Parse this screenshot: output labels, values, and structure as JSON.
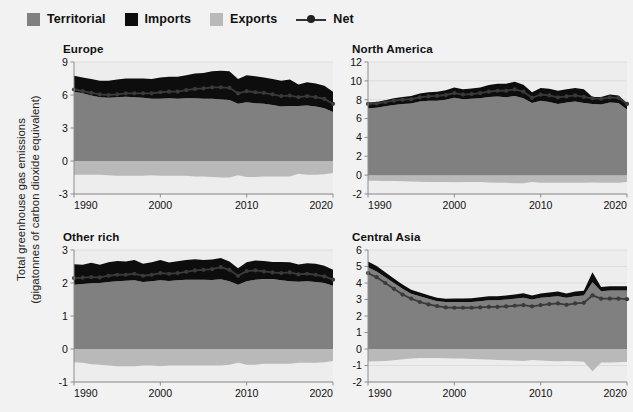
{
  "legend": {
    "items": [
      {
        "label": "Territorial",
        "icon": "square-swatch",
        "color": "#808080"
      },
      {
        "label": "Imports",
        "icon": "square-swatch",
        "color": "#0d0d0d"
      },
      {
        "label": "Exports",
        "icon": "square-swatch",
        "color": "#b9b9b9"
      },
      {
        "label": "Net",
        "icon": "line-marker-swatch",
        "color": "#333333"
      }
    ]
  },
  "axis_title": {
    "line1": "Total greenhouse gas emissions",
    "line2": "(gigatonnes of carbon dioxide equivalent)"
  },
  "colors": {
    "background": "#f2f2f2",
    "plot_background": "#ededed",
    "territorial": "#808080",
    "imports": "#0d0d0d",
    "exports": "#b9b9b9",
    "net_line": "#3a3a3a",
    "axis": "#8d8d8d",
    "grid": "#d8d8d8",
    "text": "#111111"
  },
  "chart_data": [
    {
      "type": "area",
      "title": "Europe",
      "xlabel": "",
      "ylabel": "Total greenhouse gas emissions (gigatonnes of carbon dioxide equivalent)",
      "x": [
        1990,
        1991,
        1992,
        1993,
        1994,
        1995,
        1996,
        1997,
        1998,
        1999,
        2000,
        2001,
        2002,
        2003,
        2004,
        2005,
        2006,
        2007,
        2008,
        2009,
        2010,
        2011,
        2012,
        2013,
        2014,
        2015,
        2016,
        2017,
        2018,
        2019,
        2020
      ],
      "xlim": [
        1990,
        2020
      ],
      "xticks": [
        1990,
        2000,
        2010,
        2020
      ],
      "ylim": [
        -3,
        9
      ],
      "yticks": [
        -3,
        0,
        3,
        6,
        9
      ],
      "grid": true,
      "legend_position": "top",
      "series": [
        {
          "name": "Territorial",
          "stack": "positive",
          "values": [
            6.3,
            6.15,
            5.95,
            5.8,
            5.75,
            5.8,
            5.85,
            5.8,
            5.75,
            5.65,
            5.65,
            5.7,
            5.65,
            5.7,
            5.7,
            5.65,
            5.65,
            5.6,
            5.55,
            5.2,
            5.35,
            5.25,
            5.2,
            5.1,
            4.95,
            5.0,
            5.0,
            5.05,
            4.95,
            4.8,
            4.45
          ],
          "note": "territorial emissions, gigatonnes CO2e"
        },
        {
          "name": "Imports",
          "stack": "positive",
          "values": [
            1.45,
            1.45,
            1.5,
            1.5,
            1.55,
            1.6,
            1.65,
            1.7,
            1.75,
            1.8,
            1.95,
            1.95,
            2.0,
            2.1,
            2.25,
            2.35,
            2.5,
            2.6,
            2.6,
            2.25,
            2.45,
            2.45,
            2.4,
            2.35,
            2.35,
            2.4,
            1.95,
            2.1,
            2.1,
            2.05,
            1.85
          ],
          "note": "emissions embodied in imports, stacked above territorial"
        },
        {
          "name": "Exports",
          "stack": "negative",
          "values": [
            -1.25,
            -1.25,
            -1.25,
            -1.25,
            -1.3,
            -1.35,
            -1.35,
            -1.35,
            -1.35,
            -1.3,
            -1.35,
            -1.35,
            -1.35,
            -1.35,
            -1.4,
            -1.4,
            -1.45,
            -1.5,
            -1.5,
            -1.3,
            -1.45,
            -1.45,
            -1.4,
            -1.4,
            -1.4,
            -1.4,
            -1.15,
            -1.25,
            -1.25,
            -1.2,
            -1.1
          ],
          "note": "emissions embodied in exports, plotted below zero"
        },
        {
          "name": "Net",
          "stack": "line",
          "values": [
            6.5,
            6.35,
            6.2,
            6.05,
            6.0,
            6.05,
            6.15,
            6.15,
            6.15,
            6.15,
            6.25,
            6.3,
            6.3,
            6.45,
            6.55,
            6.6,
            6.7,
            6.7,
            6.65,
            6.15,
            6.35,
            6.25,
            6.2,
            6.05,
            5.9,
            5.95,
            5.8,
            5.9,
            5.8,
            5.65,
            5.2
          ],
          "note": "net consumption emissions = territorial + imports - exports"
        }
      ]
    },
    {
      "type": "area",
      "title": "North America",
      "xlabel": "",
      "ylabel": "Total greenhouse gas emissions (gigatonnes of carbon dioxide equivalent)",
      "x": [
        1990,
        1991,
        1992,
        1993,
        1994,
        1995,
        1996,
        1997,
        1998,
        1999,
        2000,
        2001,
        2002,
        2003,
        2004,
        2005,
        2006,
        2007,
        2008,
        2009,
        2010,
        2011,
        2012,
        2013,
        2014,
        2015,
        2016,
        2017,
        2018,
        2019,
        2020
      ],
      "xlim": [
        1990,
        2020
      ],
      "xticks": [
        1990,
        2000,
        2010,
        2020
      ],
      "ylim": [
        -2,
        12
      ],
      "yticks": [
        -2,
        0,
        2,
        4,
        6,
        8,
        10,
        12
      ],
      "grid": true,
      "legend_position": "top",
      "series": [
        {
          "name": "Territorial",
          "stack": "positive",
          "values": [
            7.1,
            7.15,
            7.3,
            7.45,
            7.55,
            7.6,
            7.8,
            7.9,
            7.9,
            8.0,
            8.2,
            8.05,
            8.1,
            8.15,
            8.3,
            8.35,
            8.25,
            8.4,
            8.15,
            7.65,
            7.9,
            7.75,
            7.55,
            7.7,
            7.8,
            7.65,
            7.55,
            7.5,
            7.7,
            7.65,
            6.95
          ],
          "note": "territorial emissions, gigatonnes CO2e"
        },
        {
          "name": "Imports",
          "stack": "positive",
          "values": [
            0.6,
            0.6,
            0.65,
            0.7,
            0.75,
            0.8,
            0.85,
            0.9,
            0.95,
            1.0,
            1.1,
            1.05,
            1.1,
            1.15,
            1.25,
            1.35,
            1.45,
            1.5,
            1.45,
            1.15,
            1.35,
            1.4,
            1.4,
            1.4,
            1.45,
            1.45,
            0.75,
            0.8,
            0.85,
            0.8,
            0.7
          ],
          "note": "emissions embodied in imports, stacked above territorial"
        },
        {
          "name": "Exports",
          "stack": "negative",
          "values": [
            -0.6,
            -0.6,
            -0.62,
            -0.63,
            -0.65,
            -0.68,
            -0.7,
            -0.72,
            -0.72,
            -0.72,
            -0.75,
            -0.72,
            -0.72,
            -0.74,
            -0.78,
            -0.8,
            -0.82,
            -0.85,
            -0.85,
            -0.72,
            -0.8,
            -0.82,
            -0.8,
            -0.8,
            -0.82,
            -0.82,
            -0.78,
            -0.8,
            -0.82,
            -0.8,
            -0.72
          ],
          "note": "emissions embodied in exports, plotted below zero"
        },
        {
          "name": "Net",
          "stack": "line",
          "values": [
            7.55,
            7.6,
            7.75,
            7.9,
            8.0,
            8.05,
            8.25,
            8.35,
            8.4,
            8.5,
            8.7,
            8.55,
            8.6,
            8.7,
            8.85,
            8.95,
            8.95,
            9.1,
            8.85,
            8.2,
            8.55,
            8.45,
            8.25,
            8.35,
            8.45,
            8.3,
            8.15,
            8.1,
            8.25,
            8.2,
            7.55
          ],
          "note": "net consumption emissions = territorial + imports - exports"
        }
      ]
    },
    {
      "type": "area",
      "title": "Other rich",
      "xlabel": "",
      "ylabel": "Total greenhouse gas emissions (gigatonnes of carbon dioxide equivalent)",
      "x": [
        1990,
        1991,
        1992,
        1993,
        1994,
        1995,
        1996,
        1997,
        1998,
        1999,
        2000,
        2001,
        2002,
        2003,
        2004,
        2005,
        2006,
        2007,
        2008,
        2009,
        2010,
        2011,
        2012,
        2013,
        2014,
        2015,
        2016,
        2017,
        2018,
        2019,
        2020
      ],
      "xlim": [
        1990,
        2020
      ],
      "xticks": [
        1990,
        2000,
        2010,
        2020
      ],
      "ylim": [
        -1,
        3
      ],
      "yticks": [
        -1,
        0,
        1,
        2,
        3
      ],
      "grid": true,
      "legend_position": "top",
      "series": [
        {
          "name": "Territorial",
          "stack": "positive",
          "values": [
            1.95,
            1.97,
            1.99,
            2.0,
            2.03,
            2.05,
            2.07,
            2.08,
            2.03,
            2.05,
            2.08,
            2.06,
            2.08,
            2.1,
            2.1,
            2.1,
            2.09,
            2.11,
            2.05,
            1.95,
            2.05,
            2.1,
            2.12,
            2.12,
            2.08,
            2.05,
            2.04,
            2.05,
            2.03,
            2.0,
            1.92
          ],
          "note": "territorial emissions, gigatonnes CO2e"
        },
        {
          "name": "Imports",
          "stack": "positive",
          "values": [
            0.62,
            0.58,
            0.62,
            0.55,
            0.6,
            0.62,
            0.58,
            0.62,
            0.55,
            0.58,
            0.62,
            0.56,
            0.58,
            0.6,
            0.62,
            0.6,
            0.62,
            0.65,
            0.6,
            0.5,
            0.58,
            0.58,
            0.55,
            0.52,
            0.56,
            0.58,
            0.52,
            0.55,
            0.55,
            0.52,
            0.48
          ],
          "note": "emissions embodied in imports, stacked above territorial"
        },
        {
          "name": "Exports",
          "stack": "negative",
          "values": [
            -0.4,
            -0.42,
            -0.46,
            -0.48,
            -0.5,
            -0.52,
            -0.52,
            -0.52,
            -0.5,
            -0.5,
            -0.52,
            -0.5,
            -0.5,
            -0.5,
            -0.5,
            -0.5,
            -0.5,
            -0.5,
            -0.48,
            -0.42,
            -0.48,
            -0.48,
            -0.45,
            -0.45,
            -0.45,
            -0.45,
            -0.42,
            -0.42,
            -0.42,
            -0.4,
            -0.36
          ],
          "note": "emissions embodied in exports, plotted below zero"
        },
        {
          "name": "Net",
          "stack": "line",
          "values": [
            2.15,
            2.16,
            2.18,
            2.17,
            2.22,
            2.25,
            2.25,
            2.28,
            2.22,
            2.25,
            2.3,
            2.28,
            2.3,
            2.34,
            2.38,
            2.4,
            2.42,
            2.48,
            2.4,
            2.22,
            2.36,
            2.38,
            2.35,
            2.32,
            2.3,
            2.32,
            2.26,
            2.28,
            2.25,
            2.2,
            2.1
          ],
          "note": "net consumption emissions = territorial + imports - exports"
        }
      ]
    },
    {
      "type": "area",
      "title": "Central Asia",
      "xlabel": "",
      "ylabel": "Total greenhouse gas emissions (gigatonnes of carbon dioxide equivalent)",
      "x": [
        1990,
        1991,
        1992,
        1993,
        1994,
        1995,
        1996,
        1997,
        1998,
        1999,
        2000,
        2001,
        2002,
        2003,
        2004,
        2005,
        2006,
        2007,
        2008,
        2009,
        2010,
        2011,
        2012,
        2013,
        2014,
        2015,
        2016,
        2017,
        2018,
        2019,
        2020
      ],
      "xlim": [
        1990,
        2020
      ],
      "xticks": [
        1990,
        2000,
        2010,
        2020
      ],
      "ylim": [
        -2,
        6
      ],
      "yticks": [
        -2,
        -1,
        0,
        1,
        2,
        3,
        4,
        5,
        6
      ],
      "grid": true,
      "legend_position": "top",
      "series": [
        {
          "name": "Territorial",
          "stack": "positive",
          "values": [
            4.95,
            4.7,
            4.35,
            4.0,
            3.65,
            3.35,
            3.2,
            3.05,
            2.9,
            2.85,
            2.85,
            2.85,
            2.85,
            2.9,
            2.95,
            2.95,
            3.0,
            3.05,
            3.1,
            3.0,
            3.1,
            3.15,
            3.2,
            3.1,
            3.2,
            3.25,
            4.05,
            3.5,
            3.55,
            3.55,
            3.55
          ],
          "note": "territorial emissions, gigatonnes CO2e"
        },
        {
          "name": "Imports",
          "stack": "positive",
          "values": [
            0.35,
            0.33,
            0.3,
            0.28,
            0.26,
            0.24,
            0.22,
            0.21,
            0.2,
            0.2,
            0.21,
            0.21,
            0.22,
            0.23,
            0.24,
            0.24,
            0.25,
            0.26,
            0.28,
            0.24,
            0.26,
            0.28,
            0.28,
            0.27,
            0.28,
            0.28,
            0.6,
            0.26,
            0.26,
            0.26,
            0.26
          ],
          "note": "emissions embodied in imports, stacked above territorial"
        },
        {
          "name": "Exports",
          "stack": "negative",
          "values": [
            -0.75,
            -0.74,
            -0.72,
            -0.68,
            -0.62,
            -0.58,
            -0.55,
            -0.54,
            -0.54,
            -0.56,
            -0.58,
            -0.58,
            -0.6,
            -0.62,
            -0.64,
            -0.66,
            -0.68,
            -0.7,
            -0.72,
            -0.66,
            -0.7,
            -0.72,
            -0.74,
            -0.72,
            -0.74,
            -0.78,
            -1.35,
            -0.82,
            -0.82,
            -0.8,
            -0.78
          ],
          "note": "emissions embodied in exports, plotted below zero"
        },
        {
          "name": "Net",
          "stack": "line",
          "values": [
            4.6,
            4.35,
            4.0,
            3.65,
            3.3,
            3.05,
            2.85,
            2.7,
            2.6,
            2.52,
            2.5,
            2.5,
            2.5,
            2.52,
            2.55,
            2.55,
            2.58,
            2.62,
            2.66,
            2.58,
            2.66,
            2.72,
            2.76,
            2.68,
            2.76,
            2.8,
            3.25,
            3.05,
            3.05,
            3.05,
            3.02
          ],
          "note": "net consumption emissions = territorial + imports - exports"
        }
      ]
    }
  ]
}
